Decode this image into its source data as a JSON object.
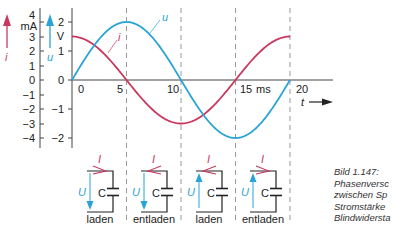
{
  "chart_data": {
    "type": "line",
    "title": "",
    "xlabel": "t",
    "x_unit": "ms",
    "x_ticks": [
      "0",
      "5",
      "10",
      "15",
      "20"
    ],
    "xlim": [
      0,
      20
    ],
    "axes": [
      {
        "name": "i",
        "unit": "mA",
        "ticks": [
          "4",
          "3",
          "2",
          "1",
          "0",
          "−1",
          "−2",
          "−3",
          "−4"
        ],
        "ylim": [
          -4,
          4
        ],
        "color": "#c8385f"
      },
      {
        "name": "u",
        "unit": "V",
        "ticks": [
          "2",
          "1",
          "0",
          "−1",
          "−2"
        ],
        "ylim": [
          -2,
          2
        ],
        "color": "#2aa3d6"
      }
    ],
    "series": [
      {
        "name": "u",
        "unit": "V",
        "color": "#2aa3d6",
        "shape": "sine",
        "amplitude": 2,
        "period_ms": 20,
        "x": [
          0,
          2.5,
          5,
          7.5,
          10,
          12.5,
          15,
          17.5,
          20
        ],
        "values": [
          0,
          1.41,
          2,
          1.41,
          0,
          -1.41,
          -2,
          -1.41,
          0
        ]
      },
      {
        "name": "i",
        "unit": "mA",
        "color": "#c8385f",
        "shape": "cosine",
        "amplitude": 3,
        "period_ms": 20,
        "x": [
          0,
          2.5,
          5,
          7.5,
          10,
          12.5,
          15,
          17.5,
          20
        ],
        "values": [
          3,
          2.12,
          0,
          -2.12,
          -3,
          -2.12,
          0,
          2.12,
          3
        ]
      }
    ],
    "grid": "vertical dashed lines at 5, 10, 15, 20 ms",
    "legend": "inline labels i and u"
  },
  "labels": {
    "i_axis_symbol": "i",
    "i_axis_unit": "mA",
    "u_axis_symbol": "u",
    "u_axis_unit": "V",
    "time_symbol": "t",
    "time_unit": "ms",
    "curve_u": "u",
    "curve_i": "i"
  },
  "circuits": [
    {
      "state": "laden",
      "current_label": "I",
      "current_dir": "right",
      "voltage_label": "U",
      "voltage_dir": "down",
      "cap_label": "C"
    },
    {
      "state": "entladen",
      "current_label": "I",
      "current_dir": "left",
      "voltage_label": "U",
      "voltage_dir": "down",
      "cap_label": "C"
    },
    {
      "state": "laden",
      "current_label": "I",
      "current_dir": "left",
      "voltage_label": "U",
      "voltage_dir": "up",
      "cap_label": "C"
    },
    {
      "state": "entladen",
      "current_label": "I",
      "current_dir": "right",
      "voltage_label": "U",
      "voltage_dir": "up",
      "cap_label": "C"
    }
  ],
  "caption": {
    "line1": "Bild 1.147:",
    "line2": "Phasenversc",
    "line3": "zwischen Sp",
    "line4": "Stromstärke",
    "line5": "Blindwidersta"
  }
}
